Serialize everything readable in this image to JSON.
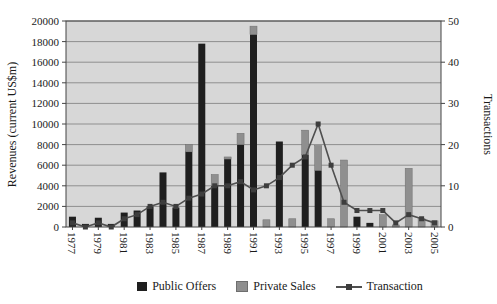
{
  "chart": {
    "left_axis_title": "Revenues (current US$m)",
    "right_axis_title": "Transactions",
    "legend": {
      "public_offers_label": "Public Offers",
      "private_sales_label": "Private Sales",
      "transaction_label": "Transaction"
    },
    "colors": {
      "public_offers": "#1f1f1f",
      "private_sales": "#8f8f8f",
      "transaction_line": "#4f4f4f",
      "transaction_marker": "#3d3d3d",
      "plot_background": "#d7d7d7",
      "gridline": "#8f8f8f",
      "axis": "#444444"
    }
  },
  "chart_data": {
    "type": "bar",
    "subtype": "stacked-bars-with-line-dual-axis",
    "x": [
      1977,
      1978,
      1979,
      1980,
      1981,
      1982,
      1983,
      1984,
      1985,
      1986,
      1987,
      1988,
      1989,
      1990,
      1991,
      1992,
      1993,
      1994,
      1995,
      1996,
      1997,
      1998,
      1999,
      2000,
      2001,
      2002,
      2003,
      2004,
      2005
    ],
    "xtick_labels": [
      "1977",
      "1979",
      "1981",
      "1983",
      "1985",
      "1987",
      "1989",
      "1991",
      "1993",
      "1995",
      "1997",
      "1999",
      "2001",
      "2003",
      "2005"
    ],
    "series": [
      {
        "name": "Public Offers",
        "type": "bar",
        "axis": "left",
        "color": "#1f1f1f",
        "values": [
          1000,
          300,
          900,
          300,
          1400,
          1600,
          2000,
          5300,
          1900,
          7300,
          17800,
          4000,
          6600,
          8000,
          18700,
          0,
          8300,
          0,
          7000,
          5500,
          0,
          0,
          1000,
          400,
          0,
          0,
          0,
          0,
          0
        ]
      },
      {
        "name": "Private Sales",
        "type": "bar",
        "axis": "left",
        "color": "#8f8f8f",
        "values": [
          0,
          0,
          0,
          0,
          0,
          0,
          0,
          0,
          0,
          700,
          0,
          1100,
          200,
          1100,
          800,
          700,
          0,
          800,
          2400,
          2400,
          800,
          6500,
          0,
          0,
          1200,
          200,
          5700,
          800,
          600
        ]
      },
      {
        "name": "Transaction",
        "type": "line",
        "axis": "right",
        "color": "#4f4f4f",
        "values": [
          1,
          0,
          1,
          0,
          2,
          3,
          5,
          6,
          5,
          7,
          8,
          10,
          10,
          11,
          9,
          10,
          12,
          15,
          17,
          25,
          15,
          6,
          4,
          4,
          4,
          1,
          3,
          2,
          1
        ]
      }
    ],
    "ylabel": "Revenues (current US$m)",
    "y2label": "Transactions",
    "ylim": [
      0,
      20000
    ],
    "ytick_step": 2000,
    "y2lim": [
      0,
      50
    ],
    "y2tick_step": 10,
    "grid": true,
    "legend_position": "bottom",
    "plot_background": "#d7d7d7"
  }
}
